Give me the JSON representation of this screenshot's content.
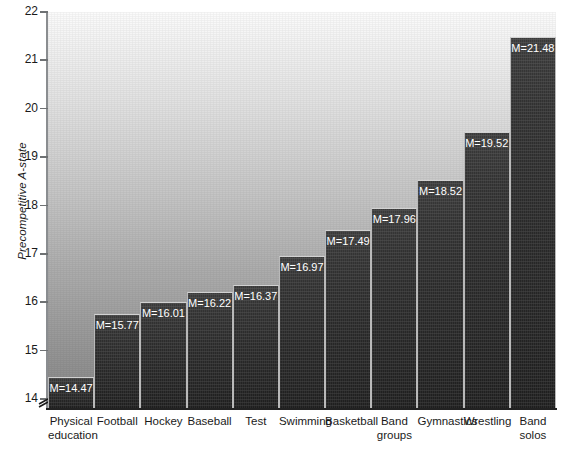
{
  "chart_data": {
    "type": "bar",
    "title": "",
    "xlabel": "",
    "ylabel": "Precompetitive A-state",
    "ylim": [
      13.8,
      22
    ],
    "yticks": [
      14,
      15,
      16,
      17,
      18,
      19,
      20,
      21,
      22
    ],
    "ytick_labels": [
      "14",
      "15",
      "16",
      "17",
      "18",
      "19",
      "20",
      "21",
      "22"
    ],
    "grid": false,
    "legend": false,
    "axis_break": true,
    "value_label_prefix": "M=",
    "categories": [
      "Physical education",
      "Football",
      "Hockey",
      "Baseball",
      "Test",
      "Swimming",
      "Basketball",
      "Band groups",
      "Gymnastics",
      "Wrestling",
      "Band solos"
    ],
    "category_lines": [
      [
        "Physical",
        "education"
      ],
      [
        "Football"
      ],
      [
        "Hockey"
      ],
      [
        "Baseball"
      ],
      [
        "Test"
      ],
      [
        "Swimming"
      ],
      [
        "Basketball"
      ],
      [
        "Band",
        "groups"
      ],
      [
        "Gymnastics"
      ],
      [
        "Wrestling"
      ],
      [
        "Band",
        "solos"
      ]
    ],
    "values": [
      14.47,
      15.77,
      16.01,
      16.22,
      16.37,
      16.97,
      17.49,
      17.96,
      18.52,
      19.52,
      21.48
    ],
    "value_labels": [
      "M=14.47",
      "M=15.77",
      "M=16.01",
      "M=16.22",
      "M=16.37",
      "M=16.97",
      "M=17.49",
      "M=17.96",
      "M=18.52",
      "M=19.52",
      "M=21.48"
    ],
    "colors": {
      "bar_top": "#3a3a3a",
      "bar_bottom": "#1e1e1e",
      "bar_edge": "#b9b9b9",
      "background_top": "#fbfbfb",
      "background_bottom": "#868686",
      "axis": "#222222",
      "label_text": "#1a1a1a",
      "value_text": "#ffffff"
    }
  }
}
